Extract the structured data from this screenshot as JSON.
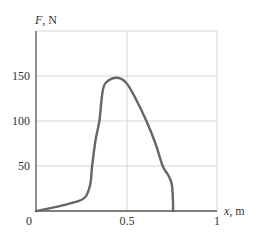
{
  "chart_data": {
    "type": "line",
    "title": "",
    "xlabel": "x, m",
    "ylabel": "F, N",
    "xlim": [
      0,
      1
    ],
    "ylim": [
      0,
      200
    ],
    "x_ticks": [
      "0",
      "0.5",
      "1"
    ],
    "y_ticks": [
      "50",
      "100",
      "150"
    ],
    "grid": true,
    "legend": null,
    "series": [
      {
        "name": "F(x)",
        "x": [
          0.0,
          0.1,
          0.2,
          0.27,
          0.3,
          0.31,
          0.33,
          0.35,
          0.37,
          0.4,
          0.45,
          0.5,
          0.55,
          0.61,
          0.66,
          0.7,
          0.73,
          0.75,
          0.757,
          0.757
        ],
        "y": [
          0,
          4,
          9,
          15,
          30,
          50,
          80,
          100,
          135,
          145,
          148,
          142,
          125,
          100,
          75,
          50,
          40,
          30,
          10,
          0
        ]
      }
    ],
    "colors": {
      "line": "#666666",
      "grid": "#d4d4d4",
      "axis": "#555555"
    }
  }
}
